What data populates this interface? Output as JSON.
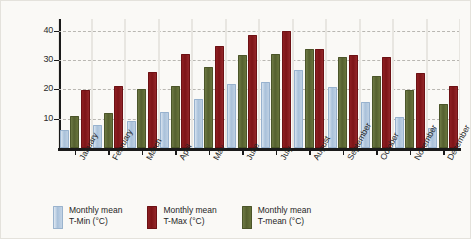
{
  "chart_data": {
    "type": "bar",
    "title": "",
    "xlabel": "",
    "ylabel": "Temperature (°C)",
    "ylim": [
      0,
      44
    ],
    "yticks": [
      10,
      20,
      30,
      40
    ],
    "ytick_labels": [
      "10",
      "20",
      "30",
      "40"
    ],
    "grid": true,
    "legend_position": "bottom",
    "categories": [
      "January",
      "February",
      "March",
      "April",
      "May",
      "June",
      "July",
      "August",
      "September",
      "October",
      "November",
      "December"
    ],
    "series": [
      {
        "name": "Monthly mean T-Min (°C)",
        "color": "#a9c1da",
        "values": [
          5.5,
          7.0,
          8.5,
          11.5,
          16.0,
          21.0,
          22.0,
          26.0,
          20.0,
          15.0,
          10.0,
          6.0
        ]
      },
      {
        "name": "Monthly mean T-Max (°C)",
        "color": "#7d1417",
        "values": [
          19.0,
          20.5,
          25.3,
          31.5,
          34.0,
          38.0,
          39.2,
          33.0,
          31.0,
          30.5,
          25.0,
          20.5
        ]
      },
      {
        "name": "Monthly mean T-mean (°C)",
        "color": "#55602f",
        "values": [
          10.3,
          11.2,
          19.5,
          20.5,
          27.0,
          31.0,
          31.5,
          33.0,
          30.3,
          24.0,
          19.0,
          14.5
        ]
      }
    ],
    "legend_entries": [
      {
        "line1": "Monthly mean",
        "line2": "T-Min (°C)",
        "swatch": "tmin"
      },
      {
        "line1": "Monthly mean",
        "line2": "T-Max (°C)",
        "swatch": "tmax"
      },
      {
        "line1": "Monthly mean",
        "line2": "T-mean (°C)",
        "swatch": "tmean"
      }
    ]
  }
}
